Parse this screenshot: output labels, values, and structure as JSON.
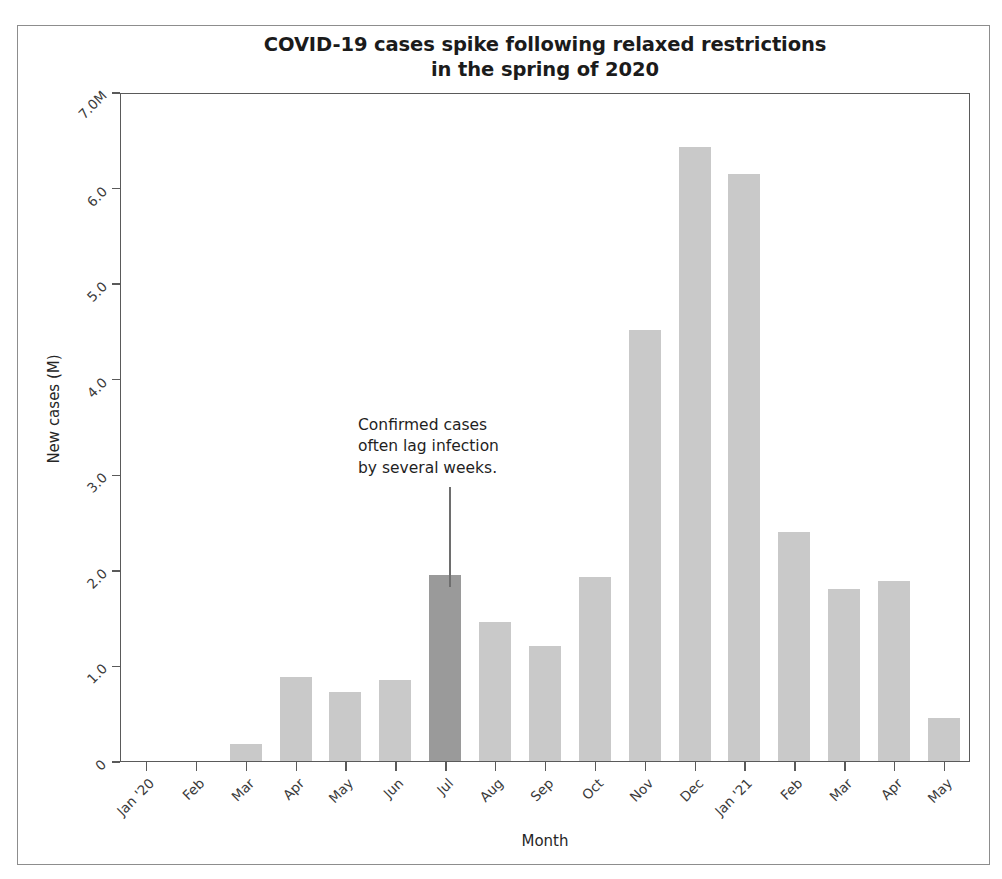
{
  "chart_data": {
    "type": "bar",
    "title": "COVID-19 cases spike following relaxed restrictions\nin the spring of 2020",
    "xlabel": "Month",
    "ylabel": "New cases (M)",
    "ylim": [
      0,
      7.0
    ],
    "grid": false,
    "legend": null,
    "categories": [
      "Jan '20",
      "Feb",
      "Mar",
      "Apr",
      "May",
      "Jun",
      "Jul",
      "Aug",
      "Sep",
      "Oct",
      "Nov",
      "Dec",
      "Jan '21",
      "Feb",
      "Mar",
      "Apr",
      "May"
    ],
    "values": [
      0.0,
      0.0,
      0.18,
      0.88,
      0.72,
      0.85,
      1.95,
      1.46,
      1.21,
      1.93,
      4.52,
      6.44,
      6.16,
      2.4,
      1.81,
      1.89,
      0.45
    ],
    "y_ticks": [
      0,
      1.0,
      2.0,
      3.0,
      4.0,
      5.0,
      6.0,
      7.0
    ],
    "y_tick_labels": [
      "0",
      "1.0",
      "2.0",
      "3.0",
      "4.0",
      "5.0",
      "6.0",
      "7.0M"
    ],
    "highlight_index": 6,
    "bar_color": "#c9c9c9",
    "highlight_color": "#9a9a9a",
    "axis_color": "#5a5a5a",
    "annotations": [
      {
        "text": "Confirmed cases\noften lag infection\nby several weeks.",
        "points_to_category": "Jul"
      }
    ]
  }
}
